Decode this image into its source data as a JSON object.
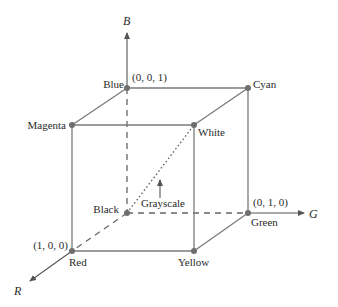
{
  "diagram": {
    "axes": {
      "B": {
        "label": "B"
      },
      "G": {
        "label": "G"
      },
      "R": {
        "label": "R"
      }
    },
    "vertices": {
      "black": {
        "label": "Black"
      },
      "blue": {
        "label": "Blue",
        "coord": "(0, 0, 1)"
      },
      "green": {
        "label": "Green",
        "coord": "(0, 1, 0)"
      },
      "red": {
        "label": "Red",
        "coord": "(1, 0, 0)"
      },
      "cyan": {
        "label": "Cyan"
      },
      "magenta": {
        "label": "Magenta"
      },
      "yellow": {
        "label": "Yellow"
      },
      "white": {
        "label": "White"
      }
    },
    "annotation": {
      "grayscale": "Grayscale"
    },
    "colors": {
      "line": "#7a7a7a",
      "dot": "#6e6e6e",
      "text": "#2a2a2a"
    }
  }
}
